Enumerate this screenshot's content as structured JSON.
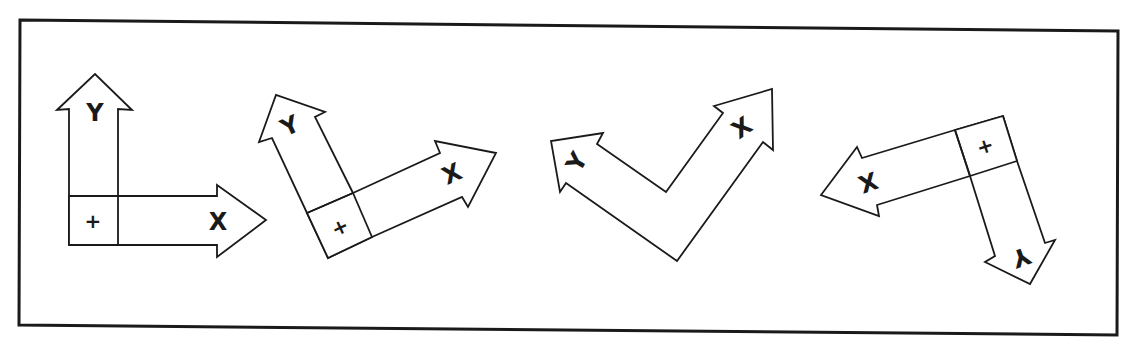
{
  "diagram": {
    "colors": {
      "stroke": "#1a1a1a",
      "fill": "#ffffff",
      "background": "#ffffff"
    },
    "figures": [
      {
        "id": "fig1",
        "x_label": "X",
        "y_label": "Y",
        "origin_label": "+",
        "orientation": "upright"
      },
      {
        "id": "fig2",
        "x_label": "X",
        "y_label": "Y",
        "origin_label": "+",
        "orientation": "rotated-ccw-25"
      },
      {
        "id": "fig3",
        "x_label": "X",
        "y_label": "Y",
        "origin_label": "",
        "orientation": "v-shape"
      },
      {
        "id": "fig4",
        "x_label": "X",
        "y_label": "Y",
        "origin_label": "+",
        "orientation": "inverted"
      }
    ]
  }
}
